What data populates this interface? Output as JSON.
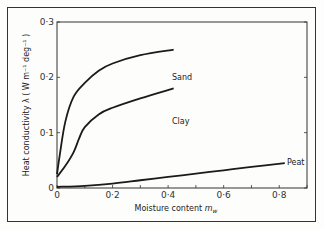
{
  "chart_data": {
    "type": "line",
    "title": "",
    "xlabel": "Moisture content m_w",
    "ylabel": "Heat conductivity λ ( W m⁻¹ deg⁻¹ )",
    "xlim": [
      0,
      0.9
    ],
    "ylim": [
      0,
      0.3
    ],
    "xticks": [
      "0",
      "0·2",
      "0·4",
      "0·6",
      "0·8"
    ],
    "yticks": [
      "0",
      "0·1",
      "0·2",
      "0·3"
    ],
    "grid": false,
    "legend": "inline labels at line ends",
    "series": [
      {
        "name": "Sand",
        "x": [
          0,
          0.01,
          0.03,
          0.06,
          0.1,
          0.15,
          0.2,
          0.3,
          0.42
        ],
        "y": [
          0.025,
          0.06,
          0.12,
          0.165,
          0.19,
          0.212,
          0.225,
          0.24,
          0.25
        ]
      },
      {
        "name": "Clay",
        "x": [
          0,
          0.03,
          0.06,
          0.08,
          0.1,
          0.15,
          0.2,
          0.3,
          0.42
        ],
        "y": [
          0.02,
          0.04,
          0.065,
          0.09,
          0.11,
          0.133,
          0.145,
          0.162,
          0.18
        ]
      },
      {
        "name": "Peat",
        "x": [
          0,
          0.1,
          0.2,
          0.3,
          0.4,
          0.5,
          0.6,
          0.7,
          0.82
        ],
        "y": [
          0.002,
          0.004,
          0.008,
          0.014,
          0.02,
          0.026,
          0.032,
          0.038,
          0.045
        ]
      }
    ]
  },
  "labels": {
    "x_axis": "Moisture content",
    "x_axis_symbol": "m",
    "x_axis_sub": "w",
    "y_axis": "Heat conductivity λ ( W m⁻¹ deg⁻¹ )",
    "origin": "0",
    "sand": "Sand",
    "clay": "Clay",
    "peat": "Peat"
  }
}
